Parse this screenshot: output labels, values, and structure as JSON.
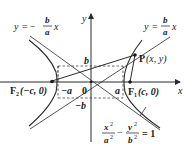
{
  "diagram": {
    "colors": {
      "stroke": "#2a2a2a",
      "text": "#1a1a1a",
      "background": "#ffffff"
    },
    "axes": {
      "x_label": "x",
      "y_label": "y",
      "origin_label": "0"
    },
    "asymptotes": {
      "negative": {
        "lhs": "y",
        "eq": "=",
        "sign": "−",
        "num": "b",
        "den": "a",
        "var": "x"
      },
      "positive": {
        "lhs": "y",
        "eq": "=",
        "num": "b",
        "den": "a",
        "var": "x"
      }
    },
    "tick_labels": {
      "b": "b",
      "neg_b": "−b",
      "a": "a",
      "neg_a": "−a"
    },
    "points": {
      "F1": {
        "name": "F",
        "sub": "1",
        "coords": "(c, 0)"
      },
      "F2": {
        "name": "F",
        "sub": "2",
        "coords": "(−c, 0)"
      },
      "P": {
        "name": "P",
        "coords": "(x, y)"
      }
    },
    "equation": {
      "term1_num": "x",
      "term1_num_exp": "2",
      "term1_den": "a",
      "term1_den_exp": "2",
      "minus": "−",
      "term2_num": "y",
      "term2_num_exp": "2",
      "term2_den": "b",
      "term2_den_exp": "2",
      "eq": "= 1"
    }
  }
}
